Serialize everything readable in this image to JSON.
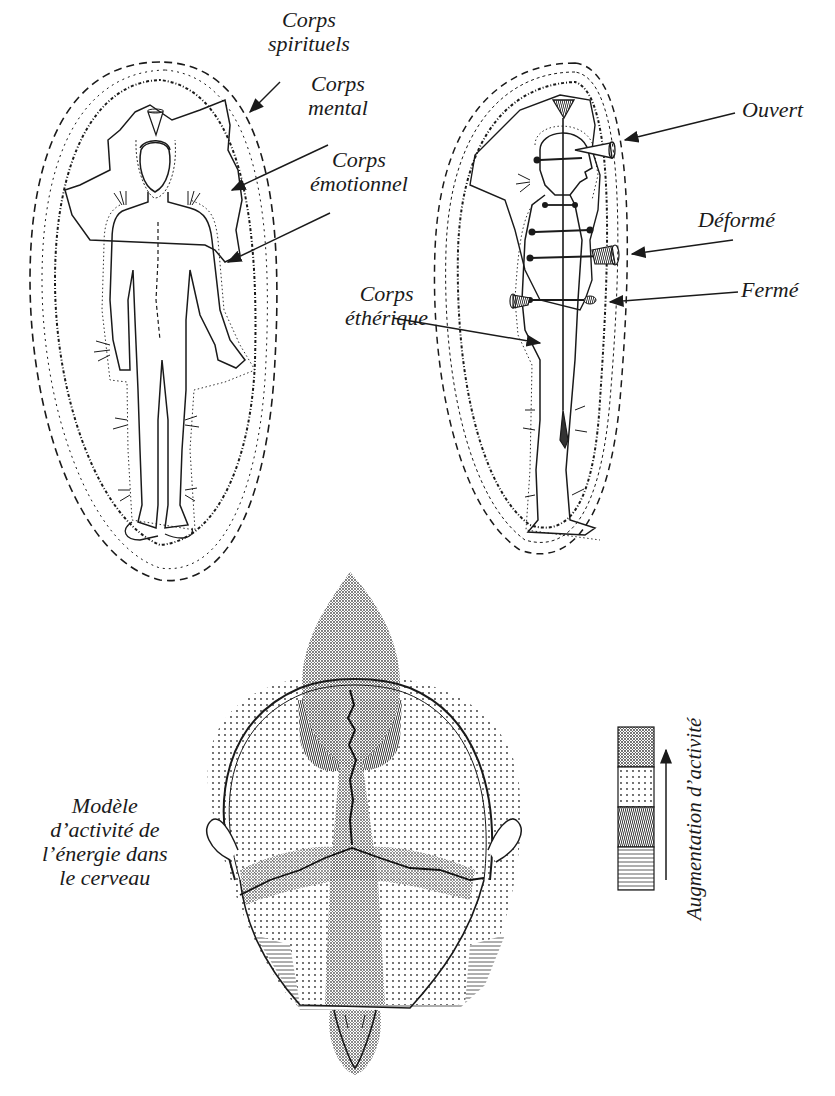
{
  "figure_1": {
    "title": "Front view — subtle bodies",
    "labels": {
      "spiritual": [
        "Corps",
        "spirituels"
      ],
      "mental": [
        "Corps",
        "mental"
      ],
      "emotional": [
        "Corps",
        "émotionnel"
      ]
    }
  },
  "figure_2": {
    "title": "Side view — chakras",
    "labels": {
      "open": "Ouvert",
      "deformed": "Déformé",
      "closed": "Fermé",
      "etheric": [
        "Corps",
        "éthérique"
      ]
    }
  },
  "figure_3": {
    "caption": [
      "Modèle",
      "d’activité de",
      "l’énergie dans",
      "le cerveau"
    ],
    "legend": {
      "title": "Augmentation d’activité",
      "arrow_direction": "up",
      "patches": [
        {
          "pattern": "dense-stipple",
          "level": "highest"
        },
        {
          "pattern": "sparse-dots",
          "level": "high"
        },
        {
          "pattern": "wavy-lines",
          "level": "medium"
        },
        {
          "pattern": "horizontal-lines",
          "level": "lowest"
        }
      ]
    }
  },
  "colors": {
    "ink": "#1a1a1a",
    "paper": "#ffffff",
    "stipple": "#8a8a8a"
  }
}
